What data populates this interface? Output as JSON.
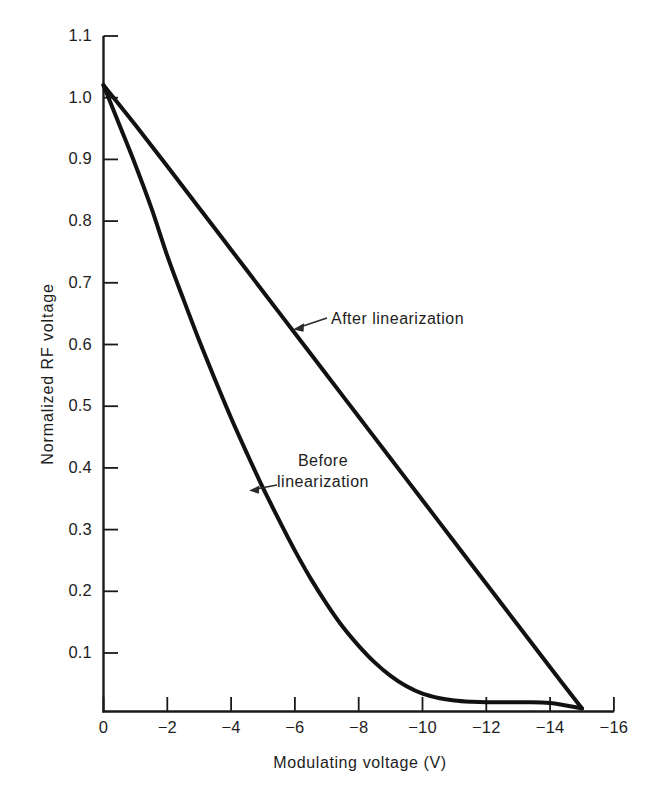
{
  "chart_data": {
    "type": "line",
    "title": "",
    "xlabel": "Modulating voltage (V)",
    "ylabel": "Normalized RF voltage",
    "xlim": [
      0,
      -16
    ],
    "ylim": [
      0,
      1.1
    ],
    "xticks": [
      0,
      -2,
      -4,
      -6,
      -8,
      -10,
      -12,
      -14,
      -16
    ],
    "xtick_labels": [
      "0",
      "−2",
      "−4",
      "−6",
      "−8",
      "−10",
      "−12",
      "−14",
      "−16"
    ],
    "yticks": [
      0.1,
      0.2,
      0.3,
      0.4,
      0.5,
      0.6,
      0.7,
      0.8,
      0.9,
      1.0,
      1.1
    ],
    "ytick_labels": [
      "0.1",
      "0.2",
      "0.3",
      "0.4",
      "0.5",
      "0.6",
      "0.7",
      "0.8",
      "0.9",
      "1.0",
      "1.1"
    ],
    "grid": false,
    "legend_position": "inline-annotations",
    "series": [
      {
        "name": "After linearization",
        "x": [
          0.0,
          -1.0,
          -2.0,
          -3.0,
          -4.0,
          -5.0,
          -6.0,
          -7.0,
          -8.0,
          -9.0,
          -10.0,
          -11.0,
          -12.0,
          -13.0,
          -14.0,
          -15.0
        ],
        "y": [
          1.02,
          0.955,
          0.888,
          0.82,
          0.752,
          0.684,
          0.616,
          0.548,
          0.48,
          0.412,
          0.344,
          0.276,
          0.208,
          0.14,
          0.072,
          0.005
        ]
      },
      {
        "name": "Before linearization",
        "x": [
          0.0,
          -0.5,
          -1.0,
          -1.5,
          -2.0,
          -2.5,
          -3.0,
          -3.5,
          -4.0,
          -4.5,
          -5.0,
          -5.5,
          -6.0,
          -6.5,
          -7.0,
          -7.5,
          -8.0,
          -8.5,
          -9.0,
          -9.5,
          -10.0,
          -10.5,
          -11.0,
          -11.5,
          -12.0,
          -13.0,
          -14.0,
          -15.0
        ],
        "y": [
          1.02,
          0.955,
          0.89,
          0.82,
          0.742,
          0.672,
          0.604,
          0.54,
          0.478,
          0.42,
          0.364,
          0.312,
          0.262,
          0.216,
          0.175,
          0.138,
          0.107,
          0.08,
          0.058,
          0.041,
          0.029,
          0.022,
          0.018,
          0.016,
          0.015,
          0.015,
          0.014,
          0.005
        ]
      }
    ],
    "annotations": [
      {
        "name": "after-linearization",
        "text": "After linearization",
        "points_to": [
          -7.3,
          0.632
        ]
      },
      {
        "name": "before-linearization",
        "line1": "Before",
        "line2": "linearization",
        "points_to": [
          -4.55,
          0.368
        ]
      }
    ]
  },
  "axis": {
    "y_title": "Normalized RF voltage",
    "x_title": "Modulating voltage (V)"
  }
}
